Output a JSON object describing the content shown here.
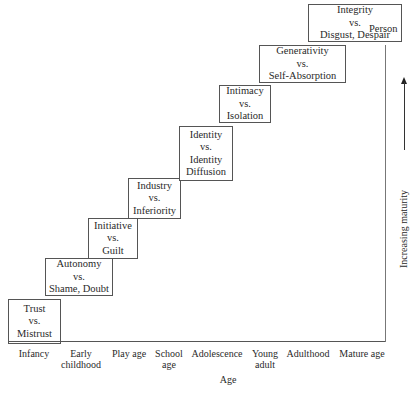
{
  "diagram": {
    "stages": [
      {
        "lines": [
          "Trust",
          "vs.",
          "Mistrust"
        ],
        "age": "Infancy"
      },
      {
        "lines": [
          "Autonomy",
          "vs.",
          "Shame, Doubt"
        ],
        "age": "Early childhood"
      },
      {
        "lines": [
          "Initiative",
          "vs.",
          "Guilt"
        ],
        "age": "Play age"
      },
      {
        "lines": [
          "Industry",
          "vs.",
          "Inferiority"
        ],
        "age": "School age"
      },
      {
        "lines": [
          "Identity",
          "vs.",
          "Identity",
          "Diffusion"
        ],
        "age": "Adolescence"
      },
      {
        "lines": [
          "Intimacy",
          "vs.",
          "Isolation"
        ],
        "age": "Young adult"
      },
      {
        "lines": [
          "Generativity",
          "vs.",
          "Self-Absorption"
        ],
        "age": "Adulthood"
      },
      {
        "lines": [
          "Integrity",
          "vs.",
          "Disgust, Despair"
        ],
        "age": "Mature age"
      }
    ],
    "x_axis": {
      "title": "Age",
      "ticks": [
        [
          "Infancy"
        ],
        [
          "Early",
          "childhood"
        ],
        [
          "Play age"
        ],
        [
          "School",
          "age"
        ],
        [
          "Adolescence"
        ],
        [
          "Young",
          "adult"
        ],
        [
          "Adulthood"
        ],
        [
          "Mature age"
        ]
      ]
    },
    "y_axis": {
      "title": "Increasing maturity",
      "top_label": "Person"
    }
  }
}
